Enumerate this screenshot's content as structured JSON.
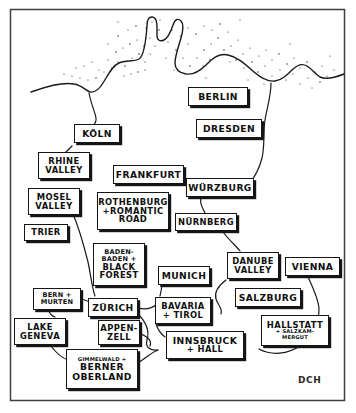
{
  "figure": {
    "kind": "hand-drawn-travel-map",
    "signature": "DCH",
    "frame": {
      "color": "#444444"
    },
    "ink_color": "#151515",
    "paper_color": "#ffffff"
  },
  "labels": [
    {
      "name": "berlin",
      "lines": [
        "BERLIN"
      ],
      "sizes": [
        "lg"
      ],
      "x": 188,
      "y": 87,
      "w": 60,
      "h": 19
    },
    {
      "name": "dresden",
      "lines": [
        "DRESDEN"
      ],
      "sizes": [
        "lg"
      ],
      "x": 196,
      "y": 119,
      "w": 66,
      "h": 19
    },
    {
      "name": "koln",
      "lines": [
        "KÖLN"
      ],
      "sizes": [
        "lg"
      ],
      "x": 74,
      "y": 124,
      "w": 46,
      "h": 19
    },
    {
      "name": "rhine-valley",
      "lines": [
        "RHINE",
        "VALLEY"
      ],
      "sizes": [
        "md",
        "md"
      ],
      "x": 38,
      "y": 152,
      "w": 52,
      "h": 27
    },
    {
      "name": "frankfurt",
      "lines": [
        "FRANKFURT"
      ],
      "sizes": [
        "lg"
      ],
      "x": 113,
      "y": 165,
      "w": 71,
      "h": 19
    },
    {
      "name": "wurzburg",
      "lines": [
        "WÜRZBURG"
      ],
      "sizes": [
        "lg"
      ],
      "x": 186,
      "y": 178,
      "w": 68,
      "h": 19
    },
    {
      "name": "mosel-valley",
      "lines": [
        "MOSEL",
        "VALLEY"
      ],
      "sizes": [
        "md",
        "md"
      ],
      "x": 28,
      "y": 188,
      "w": 52,
      "h": 27
    },
    {
      "name": "rothenburg",
      "lines": [
        "ROTHENBURG",
        "+ROMANTIC",
        "ROAD"
      ],
      "sizes": [
        "md",
        "md",
        "md"
      ],
      "x": 97,
      "y": 192,
      "w": 72,
      "h": 38
    },
    {
      "name": "trier",
      "lines": [
        "TRIER"
      ],
      "sizes": [
        "md"
      ],
      "x": 24,
      "y": 224,
      "w": 44,
      "h": 17
    },
    {
      "name": "nurnberg",
      "lines": [
        "NÜRNBERG"
      ],
      "sizes": [
        "md"
      ],
      "x": 175,
      "y": 213,
      "w": 62,
      "h": 18
    },
    {
      "name": "baden-baden-black-forest",
      "lines": [
        "BADEN-",
        "BADEN +",
        "BLACK",
        "FOREST"
      ],
      "sizes": [
        "sm",
        "sm",
        "md",
        "md"
      ],
      "x": 93,
      "y": 243,
      "w": 52,
      "h": 43
    },
    {
      "name": "danube-valley",
      "lines": [
        "DANUBE",
        "VALLEY"
      ],
      "sizes": [
        "md",
        "md"
      ],
      "x": 227,
      "y": 252,
      "w": 52,
      "h": 27
    },
    {
      "name": "vienna",
      "lines": [
        "VIENNA"
      ],
      "sizes": [
        "lg"
      ],
      "x": 285,
      "y": 257,
      "w": 55,
      "h": 19
    },
    {
      "name": "munich",
      "lines": [
        "MUNICH"
      ],
      "sizes": [
        "lg"
      ],
      "x": 158,
      "y": 266,
      "w": 52,
      "h": 19
    },
    {
      "name": "bern-murten",
      "lines": [
        "BERN +",
        "MURTEN"
      ],
      "sizes": [
        "sm",
        "sm"
      ],
      "x": 33,
      "y": 288,
      "w": 48,
      "h": 22
    },
    {
      "name": "salzburg",
      "lines": [
        "SALZBURG"
      ],
      "sizes": [
        "lg"
      ],
      "x": 235,
      "y": 288,
      "w": 66,
      "h": 19
    },
    {
      "name": "zurich",
      "lines": [
        "ZÜRICH"
      ],
      "sizes": [
        "lg"
      ],
      "x": 88,
      "y": 298,
      "w": 50,
      "h": 19
    },
    {
      "name": "bavaria-tirol",
      "lines": [
        "BAVARIA",
        "+ TIROL"
      ],
      "sizes": [
        "md",
        "md"
      ],
      "x": 155,
      "y": 297,
      "w": 56,
      "h": 27
    },
    {
      "name": "lake-geneva",
      "lines": [
        "LAKE",
        "GENEVA"
      ],
      "sizes": [
        "md",
        "md"
      ],
      "x": 14,
      "y": 318,
      "w": 52,
      "h": 27
    },
    {
      "name": "appenzell",
      "lines": [
        "APPEN-",
        "ZELL"
      ],
      "sizes": [
        "md",
        "md"
      ],
      "x": 98,
      "y": 320,
      "w": 42,
      "h": 25
    },
    {
      "name": "hallstatt-salzkammergut",
      "lines": [
        "HALLSTATT",
        "+ SALZKAM-",
        "MERGUT"
      ],
      "sizes": [
        "md",
        "xs",
        "xs"
      ],
      "x": 261,
      "y": 315,
      "w": 68,
      "h": 31
    },
    {
      "name": "innsbruck-hall",
      "lines": [
        "INNSBRUCK",
        "+ HALL"
      ],
      "sizes": [
        "lg",
        "md"
      ],
      "x": 166,
      "y": 331,
      "w": 78,
      "h": 28
    },
    {
      "name": "berner-oberland",
      "lines": [
        "GIMMELWALD +",
        "BERNER",
        "OBERLAND"
      ],
      "sizes": [
        "xs",
        "lg",
        "lg"
      ],
      "x": 66,
      "y": 349,
      "w": 72,
      "h": 40
    }
  ]
}
